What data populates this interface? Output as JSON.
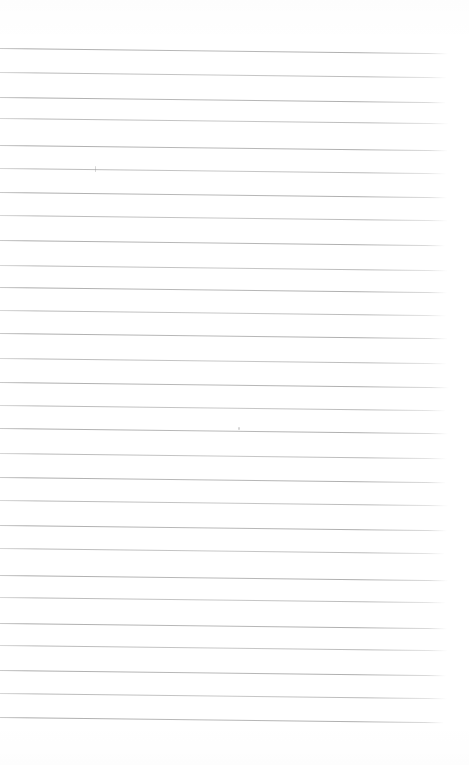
{
  "document": {
    "kind": "scanned-blank-ruled-page",
    "text_content": "",
    "background_color": "#ffffff",
    "rule_color": "#9a9a9a",
    "rule_fade_color": "#c8c8c8",
    "tilt_deg": 0.68,
    "rule_start_x": 0,
    "rule_end_x": 448,
    "rule_thickness_px": 1,
    "rule_count": 29,
    "rule_y_positions": [
      48,
      72,
      97,
      118,
      145,
      168,
      192,
      215,
      240,
      265,
      287,
      310,
      333,
      358,
      382,
      405,
      428,
      453,
      477,
      500,
      525,
      548,
      575,
      597,
      623,
      645,
      670,
      693,
      717
    ],
    "rule_widths": [
      448,
      447,
      446,
      449,
      448,
      446,
      447,
      448,
      445,
      448,
      447,
      446,
      448,
      447,
      449,
      446,
      448,
      447,
      446,
      448,
      447,
      445,
      448,
      446,
      447,
      448,
      446,
      447,
      444
    ],
    "marks": [
      {
        "type": "speck",
        "x": 95,
        "y": 166,
        "w": 1,
        "h": 6
      },
      {
        "type": "speck",
        "x": 238,
        "y": 427,
        "w": 2,
        "h": 3
      }
    ]
  }
}
